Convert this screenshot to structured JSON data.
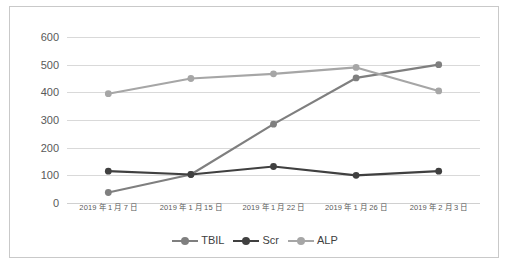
{
  "chart_data": {
    "type": "line",
    "title": "",
    "xlabel": "",
    "ylabel": "",
    "ylim": [
      0,
      600
    ],
    "yticks": [
      0,
      100,
      200,
      300,
      400,
      500,
      600
    ],
    "grid": true,
    "legend_position": "bottom",
    "categories": [
      "2019 年 1 月 7 日",
      "2019 年 1 月 15 日",
      "2019 年 1 月 22 日",
      "2019 年 1 月 26 日",
      "2019 年 2 月 3 日"
    ],
    "series": [
      {
        "name": "TBIL",
        "color": "#7f7f7f",
        "values": [
          38,
          103,
          285,
          452,
          500
        ]
      },
      {
        "name": "Scr",
        "color": "#404040",
        "values": [
          115,
          103,
          132,
          100,
          115
        ]
      },
      {
        "name": "ALP",
        "color": "#a6a6a6",
        "values": [
          395,
          450,
          467,
          490,
          405
        ]
      }
    ]
  },
  "legend": {
    "items": [
      {
        "label": "TBIL",
        "color": "#7f7f7f"
      },
      {
        "label": "Scr",
        "color": "#404040"
      },
      {
        "label": "ALP",
        "color": "#a6a6a6"
      }
    ]
  },
  "axis": {
    "y_labels": [
      "600",
      "500",
      "400",
      "300",
      "200",
      "100",
      "0"
    ]
  },
  "colors": {
    "frame_border": "#c9c9c9",
    "gridline": "#d9d9d9",
    "tick_text": "#595959",
    "background": "#ffffff"
  }
}
